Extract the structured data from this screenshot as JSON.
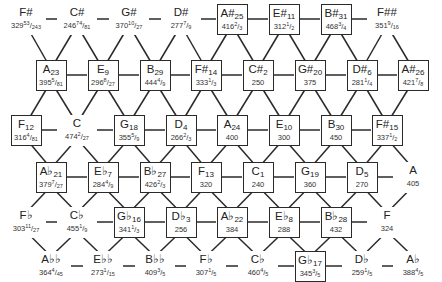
{
  "colors": {
    "line": "#2a2a2a",
    "text": "#222222",
    "background": "#ffffff"
  },
  "layout": {
    "col_spacing": 51.8,
    "row_y": [
      19,
      75,
      130,
      177,
      222,
      266
    ]
  },
  "nodes": [
    {
      "row": 0,
      "x": 26,
      "note": "F#",
      "sub": "",
      "val": "329",
      "num": "53",
      "den": "243",
      "boxed": false
    },
    {
      "row": 0,
      "x": 77,
      "note": "C#",
      "sub": "",
      "val": "246",
      "num": "74",
      "den": "81",
      "boxed": false
    },
    {
      "row": 0,
      "x": 129,
      "note": "G#",
      "sub": "",
      "val": "370",
      "num": "10",
      "den": "27",
      "boxed": false
    },
    {
      "row": 0,
      "x": 181,
      "note": "D#",
      "sub": "",
      "val": "277",
      "num": "7",
      "den": "9",
      "boxed": false
    },
    {
      "row": 0,
      "x": 232,
      "note": "A#",
      "sub": "25",
      "val": "416",
      "num": "2",
      "den": "3",
      "boxed": true
    },
    {
      "row": 0,
      "x": 284,
      "note": "E#",
      "sub": "11",
      "val": "312",
      "num": "1",
      "den": "2",
      "boxed": true
    },
    {
      "row": 0,
      "x": 336,
      "note": "B#",
      "sub": "31",
      "val": "468",
      "num": "3",
      "den": "4",
      "boxed": true
    },
    {
      "row": 0,
      "x": 387,
      "note": "F##",
      "sub": "",
      "val": "351",
      "num": "9",
      "den": "16",
      "boxed": false
    },
    {
      "row": 1,
      "x": 51,
      "note": "A",
      "sub": "23",
      "val": "395",
      "num": "5",
      "den": "81",
      "boxed": true
    },
    {
      "row": 1,
      "x": 103,
      "note": "E",
      "sub": "9",
      "val": "296",
      "num": "8",
      "den": "27",
      "boxed": true
    },
    {
      "row": 1,
      "x": 155,
      "note": "B",
      "sub": "29",
      "val": "444",
      "num": "4",
      "den": "9",
      "boxed": true
    },
    {
      "row": 1,
      "x": 206,
      "note": "F#",
      "sub": "14",
      "val": "333",
      "num": "1",
      "den": "3",
      "boxed": true
    },
    {
      "row": 1,
      "x": 258,
      "note": "C#",
      "sub": "2",
      "val": "250",
      "num": "",
      "den": "",
      "boxed": true
    },
    {
      "row": 1,
      "x": 310,
      "note": "G#",
      "sub": "20",
      "val": "375",
      "num": "",
      "den": "",
      "boxed": true
    },
    {
      "row": 1,
      "x": 362,
      "note": "D#",
      "sub": "6",
      "val": "281",
      "num": "1",
      "den": "4",
      "boxed": true
    },
    {
      "row": 1,
      "x": 413,
      "note": "A#",
      "sub": "26",
      "val": "421",
      "num": "7",
      "den": "8",
      "boxed": true
    },
    {
      "row": 2,
      "x": 26,
      "note": "F",
      "sub": "12",
      "val": "316",
      "num": "4",
      "den": "81",
      "boxed": true
    },
    {
      "row": 2,
      "x": 77,
      "note": "C",
      "sub": "",
      "val": "474",
      "num": "2",
      "den": "27",
      "boxed": false
    },
    {
      "row": 2,
      "x": 129,
      "note": "G",
      "sub": "18",
      "val": "355",
      "num": "5",
      "den": "9",
      "boxed": true
    },
    {
      "row": 2,
      "x": 181,
      "note": "D",
      "sub": "4",
      "val": "266",
      "num": "2",
      "den": "3",
      "boxed": true
    },
    {
      "row": 2,
      "x": 232,
      "note": "A",
      "sub": "24",
      "val": "400",
      "num": "",
      "den": "",
      "boxed": true
    },
    {
      "row": 2,
      "x": 284,
      "note": "E",
      "sub": "10",
      "val": "300",
      "num": "",
      "den": "",
      "boxed": true
    },
    {
      "row": 2,
      "x": 336,
      "note": "B",
      "sub": "30",
      "val": "450",
      "num": "",
      "den": "",
      "boxed": true
    },
    {
      "row": 2,
      "x": 387,
      "note": "F#",
      "sub": "15",
      "val": "337",
      "num": "1",
      "den": "2",
      "boxed": true
    },
    {
      "row": 3,
      "x": 51,
      "note": "A♭",
      "sub": "21",
      "val": "379",
      "num": "7",
      "den": "27",
      "boxed": true
    },
    {
      "row": 3,
      "x": 103,
      "note": "E♭",
      "sub": "7",
      "val": "284",
      "num": "4",
      "den": "9",
      "boxed": true
    },
    {
      "row": 3,
      "x": 155,
      "note": "B♭",
      "sub": "27",
      "val": "426",
      "num": "2",
      "den": "3",
      "boxed": true
    },
    {
      "row": 3,
      "x": 206,
      "note": "F",
      "sub": "13",
      "val": "320",
      "num": "",
      "den": "",
      "boxed": true
    },
    {
      "row": 3,
      "x": 258,
      "note": "C",
      "sub": "1",
      "val": "240",
      "num": "",
      "den": "",
      "boxed": true
    },
    {
      "row": 3,
      "x": 310,
      "note": "G",
      "sub": "19",
      "val": "360",
      "num": "",
      "den": "",
      "boxed": true
    },
    {
      "row": 3,
      "x": 362,
      "note": "D",
      "sub": "5",
      "val": "270",
      "num": "",
      "den": "",
      "boxed": true
    },
    {
      "row": 3,
      "x": 413,
      "note": "A",
      "sub": "",
      "val": "405",
      "num": "",
      "den": "",
      "boxed": false
    },
    {
      "row": 4,
      "x": 26,
      "note": "F♭",
      "sub": "",
      "val": "303",
      "num": "11",
      "den": "27",
      "boxed": false
    },
    {
      "row": 4,
      "x": 77,
      "note": "C♭",
      "sub": "",
      "val": "455",
      "num": "1",
      "den": "9",
      "boxed": false
    },
    {
      "row": 4,
      "x": 129,
      "note": "G♭",
      "sub": "16",
      "val": "341",
      "num": "1",
      "den": "3",
      "boxed": true
    },
    {
      "row": 4,
      "x": 181,
      "note": "D♭",
      "sub": "3",
      "val": "256",
      "num": "",
      "den": "",
      "boxed": true
    },
    {
      "row": 4,
      "x": 232,
      "note": "A♭",
      "sub": "22",
      "val": "384",
      "num": "",
      "den": "",
      "boxed": true
    },
    {
      "row": 4,
      "x": 284,
      "note": "E♭",
      "sub": "8",
      "val": "288",
      "num": "",
      "den": "",
      "boxed": true
    },
    {
      "row": 4,
      "x": 336,
      "note": "B♭",
      "sub": "28",
      "val": "432",
      "num": "",
      "den": "",
      "boxed": true
    },
    {
      "row": 4,
      "x": 387,
      "note": "F",
      "sub": "",
      "val": "324",
      "num": "",
      "den": "",
      "boxed": false
    },
    {
      "row": 5,
      "x": 51,
      "note": "A♭♭",
      "sub": "",
      "val": "364",
      "num": "4",
      "den": "45",
      "boxed": false
    },
    {
      "row": 5,
      "x": 103,
      "note": "E♭♭",
      "sub": "",
      "val": "273",
      "num": "1",
      "den": "15",
      "boxed": false
    },
    {
      "row": 5,
      "x": 155,
      "note": "B♭♭",
      "sub": "",
      "val": "409",
      "num": "3",
      "den": "5",
      "boxed": false
    },
    {
      "row": 5,
      "x": 206,
      "note": "F♭",
      "sub": "",
      "val": "307",
      "num": "1",
      "den": "5",
      "boxed": false
    },
    {
      "row": 5,
      "x": 258,
      "note": "C♭",
      "sub": "",
      "val": "460",
      "num": "4",
      "den": "5",
      "boxed": false
    },
    {
      "row": 5,
      "x": 310,
      "note": "G♭",
      "sub": "17",
      "val": "345",
      "num": "3",
      "den": "5",
      "boxed": true
    },
    {
      "row": 5,
      "x": 362,
      "note": "D♭",
      "sub": "",
      "val": "259",
      "num": "1",
      "den": "5",
      "boxed": false
    },
    {
      "row": 5,
      "x": 413,
      "note": "A♭",
      "sub": "",
      "val": "388",
      "num": "4",
      "den": "5",
      "boxed": false
    }
  ]
}
